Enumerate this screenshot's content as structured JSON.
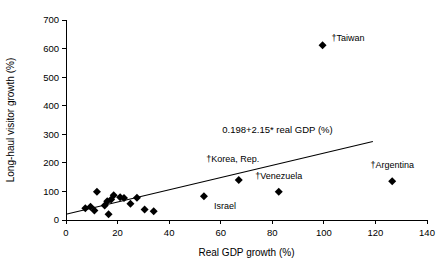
{
  "chart_data": {
    "type": "scatter",
    "title": "",
    "xlabel": "Real GDP growth (%)",
    "ylabel": "Long-haul visitor growth (%)",
    "xlim": [
      0,
      140
    ],
    "ylim": [
      0,
      700
    ],
    "xticks": [
      0,
      20,
      40,
      60,
      80,
      100,
      120,
      140
    ],
    "yticks": [
      0,
      100,
      200,
      300,
      400,
      500,
      600,
      700
    ],
    "xtick_labels": [
      "0",
      "20",
      "40",
      "60",
      "80",
      "100",
      "120",
      "140"
    ],
    "ytick_labels": [
      "0",
      "100",
      "200",
      "300",
      "400",
      "500",
      "600",
      "700"
    ],
    "grid": false,
    "legend": "none",
    "annotations": [
      {
        "name": "regression-equation",
        "text": "0.198+2.15* real GDP (%)",
        "x": 82,
        "y": 305
      }
    ],
    "trendline": {
      "name": "regression-line",
      "label": "0.198+2.15* real GDP (%)",
      "intercept": 19.8,
      "slope": 2.15,
      "x_start": 0,
      "x_end": 119,
      "y_start": 20,
      "y_end": 275
    },
    "points": [
      {
        "label": "",
        "x": 7.5,
        "y": 41
      },
      {
        "label": "",
        "x": 9.5,
        "y": 46
      },
      {
        "label": "",
        "x": 11.0,
        "y": 33
      },
      {
        "label": "",
        "x": 12.0,
        "y": 99
      },
      {
        "label": "",
        "x": 15.0,
        "y": 51
      },
      {
        "label": "",
        "x": 16.0,
        "y": 66
      },
      {
        "label": "",
        "x": 16.5,
        "y": 20
      },
      {
        "label": "",
        "x": 17.5,
        "y": 72
      },
      {
        "label": "",
        "x": 18.5,
        "y": 87
      },
      {
        "label": "",
        "x": 21.0,
        "y": 80
      },
      {
        "label": "",
        "x": 22.5,
        "y": 77
      },
      {
        "label": "",
        "x": 25.0,
        "y": 57
      },
      {
        "label": "",
        "x": 27.5,
        "y": 78
      },
      {
        "label": "",
        "x": 30.5,
        "y": 37
      },
      {
        "label": "",
        "x": 34.0,
        "y": 31
      },
      {
        "label": "Israel",
        "x": 53.5,
        "y": 83
      },
      {
        "label": "†Korea, Rep.",
        "x": 67.0,
        "y": 140
      },
      {
        "label": "†Venezuela",
        "x": 82.5,
        "y": 99
      },
      {
        "label": "†Taiwan",
        "x": 99.5,
        "y": 612
      },
      {
        "label": "†Argentina",
        "x": 126.5,
        "y": 136
      }
    ],
    "point_labels": [
      {
        "name": "label-taiwan",
        "text": "†Taiwan",
        "data_x": 99.5,
        "data_y": 612,
        "anchor": "start",
        "dx": 9,
        "dy": -4
      },
      {
        "name": "label-korea-rep",
        "text": "†Korea, Rep.",
        "data_x": 67.0,
        "data_y": 140,
        "anchor": "middle",
        "dx": -6,
        "dy": -18
      },
      {
        "name": "label-venezuela",
        "text": "†Venezuela",
        "data_x": 82.5,
        "data_y": 99,
        "anchor": "middle",
        "dx": 0,
        "dy": -13
      },
      {
        "name": "label-argentina",
        "text": "†Argentina",
        "data_x": 126.5,
        "data_y": 136,
        "anchor": "middle",
        "dx": 0,
        "dy": -13
      },
      {
        "name": "label-israel",
        "text": "Israel",
        "data_x": 53.5,
        "data_y": 83,
        "anchor": "start",
        "dx": 10,
        "dy": 13
      }
    ]
  },
  "colors": {
    "background": "#ffffff",
    "axis": "#000000",
    "marker": "#000000",
    "text": "#000000"
  }
}
